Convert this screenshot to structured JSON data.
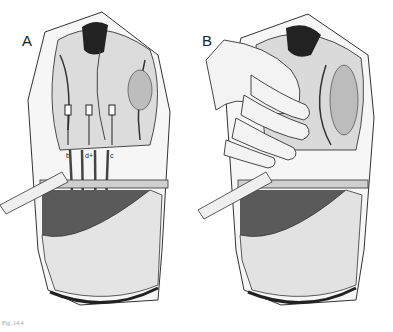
{
  "figure": {
    "panels": [
      {
        "label": "A",
        "description": "Surgical field with retracted abdominal wall, organs, and three labeled drains/catheters passing downward",
        "drain_labels": [
          "b",
          "d+",
          "c"
        ]
      },
      {
        "label": "B",
        "description": "Surgeon's hand retracting organs within open surgical field"
      }
    ],
    "caption": "Fig. 14.4"
  },
  "colors": {
    "ink": "#1a1a1a",
    "shade_dark": "#555555",
    "shade_mid": "#9a9a9a",
    "shade_light": "#d8d8d8",
    "paper": "#ffffff"
  }
}
